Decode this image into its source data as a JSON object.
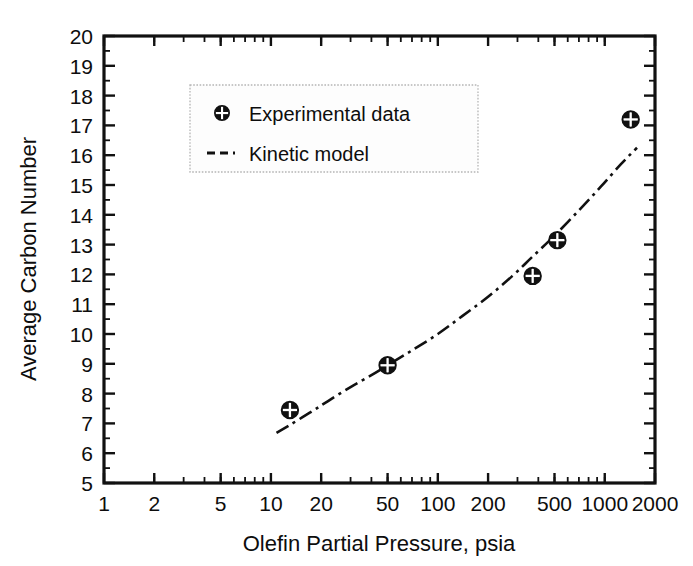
{
  "chart_data": {
    "type": "scatter",
    "title": "",
    "xlabel": "Olefin Partial Pressure, psia",
    "ylabel": "Average Carbon Number",
    "xscale": "log",
    "yscale": "linear",
    "xlim": [
      1,
      2000
    ],
    "ylim": [
      5,
      20
    ],
    "grid": false,
    "legend_position": "upper-left-inside",
    "xticks": [
      1,
      2,
      5,
      10,
      20,
      50,
      100,
      200,
      500,
      1000,
      2000
    ],
    "xticklabels": [
      "1",
      "2",
      "5",
      "10",
      "20",
      "50",
      "100",
      "200",
      "500",
      "1000",
      "2000"
    ],
    "yticks": [
      5,
      6,
      7,
      8,
      9,
      10,
      11,
      12,
      13,
      14,
      15,
      16,
      17,
      18,
      19,
      20
    ],
    "yticklabels": [
      "5",
      "6",
      "7",
      "8",
      "9",
      "10",
      "11",
      "12",
      "13",
      "14",
      "15",
      "16",
      "17",
      "18",
      "19",
      "20"
    ],
    "series": [
      {
        "name": "Experimental data",
        "type": "scatter",
        "marker": "circle-cross",
        "color": "#111111",
        "points": [
          {
            "x": 13,
            "y": 7.45
          },
          {
            "x": 50,
            "y": 8.95
          },
          {
            "x": 370,
            "y": 11.95
          },
          {
            "x": 520,
            "y": 13.15
          },
          {
            "x": 1430,
            "y": 17.2
          }
        ]
      },
      {
        "name": "Kinetic model",
        "type": "line",
        "linestyle": "dash-dot",
        "color": "#111111",
        "points": [
          {
            "x": 10.8,
            "y": 6.68
          },
          {
            "x": 13,
            "y": 6.95
          },
          {
            "x": 17,
            "y": 7.35
          },
          {
            "x": 22,
            "y": 7.75
          },
          {
            "x": 30,
            "y": 8.22
          },
          {
            "x": 40,
            "y": 8.62
          },
          {
            "x": 50,
            "y": 8.95
          },
          {
            "x": 70,
            "y": 9.45
          },
          {
            "x": 100,
            "y": 10.0
          },
          {
            "x": 140,
            "y": 10.6
          },
          {
            "x": 200,
            "y": 11.25
          },
          {
            "x": 280,
            "y": 11.95
          },
          {
            "x": 370,
            "y": 12.6
          },
          {
            "x": 500,
            "y": 13.3
          },
          {
            "x": 700,
            "y": 14.15
          },
          {
            "x": 950,
            "y": 14.95
          },
          {
            "x": 1250,
            "y": 15.7
          },
          {
            "x": 1560,
            "y": 16.25
          }
        ]
      }
    ]
  },
  "legend": {
    "entries": [
      {
        "label": "Experimental data",
        "glyph": "circle-cross-marker"
      },
      {
        "label": "Kinetic model",
        "glyph": "dashed-line-swatch"
      }
    ]
  },
  "colors": {
    "axis": "#111111",
    "data": "#111111",
    "legend_border": "#b5b5b5",
    "background": "#ffffff"
  }
}
